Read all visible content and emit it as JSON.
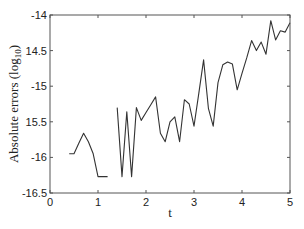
{
  "chart_data": {
    "type": "line",
    "title": "",
    "xlabel": "t",
    "ylabel": "Absolute errors (log10)",
    "ylabel_main": "Absolute errors (log",
    "ylabel_sub": "10",
    "ylabel_close": ")",
    "xlim": [
      0,
      5
    ],
    "ylim": [
      -16.5,
      -14
    ],
    "grid": false,
    "legend": null,
    "x_ticks": [
      0,
      1,
      2,
      3,
      4,
      5
    ],
    "x_tick_labels": [
      "0",
      "1",
      "2",
      "3",
      "4",
      "5"
    ],
    "y_ticks": [
      -14,
      -14.5,
      -15,
      -15.5,
      -16,
      -16.5
    ],
    "y_tick_labels": [
      "-14",
      "14.5",
      "-15",
      "15.5",
      "-16",
      "-16.5"
    ],
    "line_color": "#333333",
    "series": [
      {
        "name": "segment-1",
        "x": [
          0.4,
          0.5,
          0.6,
          0.7,
          0.8,
          0.9,
          1.0,
          1.1,
          1.2
        ],
        "y": [
          -15.95,
          -15.95,
          -15.8,
          -15.66,
          -15.78,
          -15.95,
          -16.27,
          -16.27,
          -16.27
        ]
      },
      {
        "name": "segment-2",
        "x": [
          1.4,
          1.5,
          1.6,
          1.7,
          1.8,
          1.9,
          2.0,
          2.1,
          2.2,
          2.3,
          2.4,
          2.5,
          2.6,
          2.7,
          2.8,
          2.9,
          3.0,
          3.1,
          3.2,
          3.3,
          3.4,
          3.5,
          3.6,
          3.7,
          3.8,
          3.9,
          4.0,
          4.1,
          4.2,
          4.3,
          4.4,
          4.5,
          4.6,
          4.7,
          4.8,
          4.9,
          5.0
        ],
        "y": [
          -15.3,
          -16.27,
          -15.36,
          -16.27,
          -15.3,
          -15.48,
          -15.37,
          -15.26,
          -15.15,
          -15.66,
          -15.78,
          -15.5,
          -15.43,
          -15.78,
          -15.19,
          -15.25,
          -15.56,
          -15.1,
          -14.63,
          -15.31,
          -15.56,
          -14.95,
          -14.7,
          -14.66,
          -14.69,
          -15.05,
          -14.82,
          -14.6,
          -14.36,
          -14.5,
          -14.38,
          -14.55,
          -14.08,
          -14.35,
          -14.22,
          -14.24,
          -14.11
        ]
      }
    ]
  }
}
